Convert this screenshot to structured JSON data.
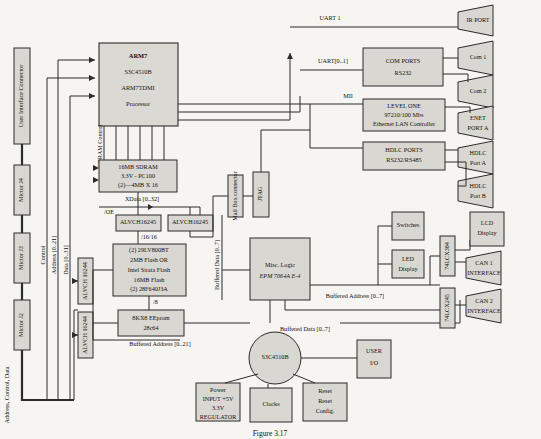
{
  "figure": {
    "caption": "Figure 3.17"
  },
  "left_column": {
    "connector": "User Interface Connector",
    "mictors": [
      "Mictor J4",
      "Mictor J3",
      "Mictor J2"
    ],
    "bus_labels": {
      "address_control_data": "Address, Control, Data",
      "control": "Control",
      "address": "Address [0..21]",
      "data": "Data [0..31]"
    }
  },
  "processor": {
    "lines": [
      "ARM7",
      "S3C4510B",
      "ARM7TDMI",
      "Processor"
    ],
    "sdram_control": "SDRAM Control"
  },
  "memory": {
    "sdram": [
      "16MB SDRAM",
      "3.3V - PC100",
      "(2)—4MB X 16"
    ],
    "xdata_label": "XData [0..32]",
    "buffers_top": [
      "ALVCH16245",
      "ALVCH16245"
    ],
    "bus_16_16": "/16/16",
    "oe_label": "/OE",
    "flash": [
      "(2) 29LV800BT",
      "2MB Flash OR",
      "Intel Strata Flash",
      "16MB Flash",
      "(2) 28F640J3A"
    ],
    "bus_8_a": "/8",
    "bus_8_b": "/8",
    "eeprom": [
      "8KX8 EEprom",
      "28c64"
    ],
    "buffered_address_21": "Buffered Address [0..21]",
    "buffers_left": [
      "ALVCH 16244",
      "ALVCH 16244"
    ]
  },
  "middle": {
    "mail_box": "Mail Box connector",
    "jtag": "JTAG",
    "buffered_data_7_v": "Buffered Data [0..7]",
    "misc_logic": [
      "Misc. Logic",
      "EPM 7064A E-4"
    ],
    "buffered_address_7": "Buffered Address [0..7]",
    "buffered_data_7": "Buffered Data [0..7]"
  },
  "comms": {
    "uart1": "UART 1",
    "uart01": "UART[0..1]",
    "mii": "MII",
    "com_ports": [
      "COM PORTS",
      "RS232"
    ],
    "level_one": [
      "LEVEL ONE",
      "97210/100 Mbs",
      "Ethernet LAN Controller"
    ],
    "hdlc_ports": [
      "HDLC PORTS",
      "RS232/RS485"
    ]
  },
  "ports": {
    "ir": "IR PORT",
    "com1": "Com 1",
    "com2": "Com 2",
    "enet": [
      "ENET",
      "PORT A"
    ],
    "hdlc_a": [
      "HDLC",
      "Port A"
    ],
    "hdlc_b": [
      "HDLC",
      "Port B"
    ],
    "can1": [
      "CAN 1",
      "INTERFACE"
    ],
    "can2": [
      "CAN 2",
      "INTERFACE"
    ]
  },
  "io": {
    "switches": "Switches",
    "led_display": [
      "LED",
      "Display"
    ],
    "driver_384": "74LCX384",
    "driver_245": "74LCX245",
    "lcd_display": [
      "LCD",
      "Display"
    ]
  },
  "power": {
    "chip": "S3C4510B",
    "supply": [
      "Power",
      "INPUT +5V",
      "3.3V",
      "REGULATOR"
    ],
    "clocks": "Clocks",
    "reset": [
      "Reset",
      "Reset",
      "Config."
    ],
    "user_io": [
      "USER",
      "I/O"
    ]
  }
}
